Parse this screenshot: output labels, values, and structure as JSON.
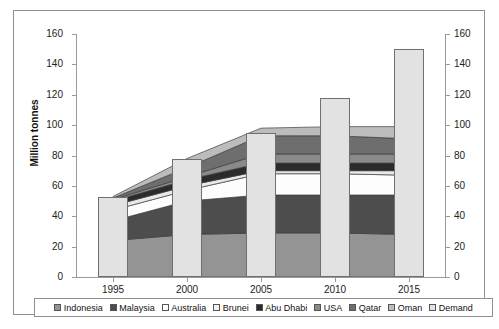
{
  "top_sliver_text": "",
  "chart_data": {
    "type": "area",
    "title": "",
    "subtitle": "",
    "xlabel": "",
    "ylabel": "Million tonnes",
    "x": [
      1995,
      2000,
      2005,
      2010,
      2015
    ],
    "tick_labels_x": [
      "1995",
      "2000",
      "2005",
      "2010",
      "2015"
    ],
    "tick_labels_y": [
      "0",
      "20",
      "40",
      "60",
      "80",
      "100",
      "120",
      "140",
      "160"
    ],
    "ylim": [
      0,
      160
    ],
    "ytick_step": 20,
    "axis_left_labels": [
      "160",
      "140",
      "120",
      "100",
      "80",
      "60",
      "40",
      "20",
      "0"
    ],
    "axis_right_labels": [
      "160",
      "140",
      "120",
      "100",
      "80",
      "60",
      "40",
      "20",
      "0"
    ],
    "grid": false,
    "legend_position": "bottom",
    "stacking": "cumulative-area",
    "series": [
      {
        "name": "Indonesia",
        "color": "#949494",
        "values": [
          24,
          28,
          29,
          29,
          28
        ]
      },
      {
        "name": "Malaysia",
        "color": "#4d4d4d",
        "values": [
          37,
          50,
          54,
          54,
          54
        ]
      },
      {
        "name": "Australia",
        "color": "#fdfdfd",
        "values": [
          44,
          57,
          68,
          68,
          67
        ]
      },
      {
        "name": "Brunei",
        "color": "#e9e9e9",
        "values": [
          47,
          60,
          70,
          70,
          70
        ]
      },
      {
        "name": "Abu Dhabi",
        "color": "#2b2b2b",
        "values": [
          50,
          64,
          75,
          75,
          75
        ]
      },
      {
        "name": "USA",
        "color": "#8a8a8a",
        "values": [
          51,
          66,
          81,
          81,
          81
        ]
      },
      {
        "name": "Qatar",
        "color": "#6e6e6e",
        "values": [
          52,
          72,
          93,
          93,
          91
        ]
      },
      {
        "name": "Oman",
        "color": "#bcbcbc",
        "values": [
          53,
          78,
          98,
          99,
          99
        ]
      }
    ],
    "demand": {
      "name": "Demand",
      "color": "#e2e2e2",
      "values": [
        53,
        78,
        95,
        118,
        150
      ]
    }
  },
  "legend": {
    "items": [
      {
        "label": "Indonesia",
        "color": "#949494"
      },
      {
        "label": "Malaysia",
        "color": "#4d4d4d"
      },
      {
        "label": "Australia",
        "color": "#ffffff"
      },
      {
        "label": "Brunei",
        "color": "#f2f2f2"
      },
      {
        "label": "Abu Dhabi",
        "color": "#2b2b2b"
      },
      {
        "label": "USA",
        "color": "#8a8a8a"
      },
      {
        "label": "Qatar",
        "color": "#6e6e6e"
      },
      {
        "label": "Oman",
        "color": "#bcbcbc"
      },
      {
        "label": "Demand",
        "color": "#e2e2e2"
      }
    ]
  }
}
